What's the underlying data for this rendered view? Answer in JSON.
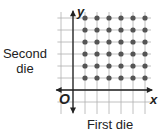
{
  "chart_data": {
    "type": "scatter",
    "title": "",
    "xlabel": "First die",
    "ylabel": "Second die",
    "axis_x_label": "x",
    "axis_y_label": "y",
    "origin_label": "O",
    "grid": true,
    "xlim": [
      -1,
      6.5
    ],
    "ylim": [
      -1,
      6.5
    ],
    "points": [
      [
        1,
        1
      ],
      [
        2,
        1
      ],
      [
        3,
        1
      ],
      [
        4,
        1
      ],
      [
        5,
        1
      ],
      [
        6,
        1
      ],
      [
        1,
        2
      ],
      [
        2,
        2
      ],
      [
        3,
        2
      ],
      [
        4,
        2
      ],
      [
        5,
        2
      ],
      [
        6,
        2
      ],
      [
        1,
        3
      ],
      [
        2,
        3
      ],
      [
        3,
        3
      ],
      [
        4,
        3
      ],
      [
        5,
        3
      ],
      [
        6,
        3
      ],
      [
        1,
        4
      ],
      [
        2,
        4
      ],
      [
        3,
        4
      ],
      [
        4,
        4
      ],
      [
        5,
        4
      ],
      [
        6,
        4
      ],
      [
        1,
        5
      ],
      [
        2,
        5
      ],
      [
        3,
        5
      ],
      [
        4,
        5
      ],
      [
        5,
        5
      ],
      [
        6,
        5
      ],
      [
        1,
        6
      ],
      [
        2,
        6
      ],
      [
        3,
        6
      ],
      [
        4,
        6
      ],
      [
        5,
        6
      ],
      [
        6,
        6
      ]
    ],
    "point_color": "#555555"
  },
  "labels": {
    "ylabel_line1": "Second",
    "ylabel_line2": "die",
    "xlabel": "First die",
    "x_axis": "x",
    "y_axis": "y",
    "origin": "O"
  }
}
